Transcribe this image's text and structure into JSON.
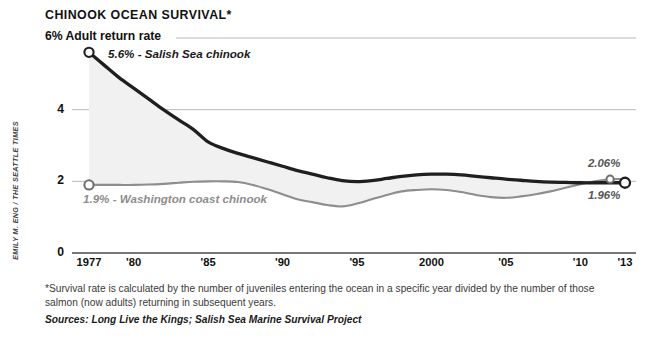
{
  "credit": {
    "text": "EMILY M. ENG / THE SEATTLE TIMES"
  },
  "header": {
    "title": "CHINOOK OCEAN SURVIVAL*",
    "y_axis_top_label": "6% Adult return rate"
  },
  "annotations": {
    "salish_start": "5.6% - Salish Sea chinook",
    "washington_start": "1.9% - Washington coast chinook",
    "washington_end": "2.06%",
    "salish_end": "1.96%"
  },
  "footnotes": {
    "note": "*Survival rate is calculated by the number of juveniles entering the ocean in a specific year divided by the number of those salmon (now adults) returning in subsequent years.",
    "sources": "Sources: Long Live the Kings; Salish Sea Marine Survival Project"
  },
  "colors": {
    "salish_line": "#1f1f1f",
    "washington_line": "#8d8d8d",
    "band_fill": "#f1f1f1",
    "gridline": "#b9b9b9",
    "axis": "#4a4a4a",
    "text": "#111111",
    "muted_text": "#8d8d8d"
  },
  "chart_data": {
    "type": "line",
    "title": "CHINOOK OCEAN SURVIVAL*",
    "subtitle": "",
    "xlabel": "",
    "ylabel": "Adult return rate",
    "units": "%",
    "xlim": [
      1977,
      2013
    ],
    "ylim": [
      0,
      6
    ],
    "yticks": [
      0,
      2,
      4,
      6
    ],
    "ytick_labels": [
      "0",
      "2",
      "4",
      "6"
    ],
    "xticks": [
      1977,
      1980,
      1985,
      1990,
      1995,
      2000,
      2005,
      2010,
      2013
    ],
    "xtick_labels": [
      "1977",
      "'80",
      "'85",
      "'90",
      "'95",
      "2000",
      "'05",
      "'10",
      "'13"
    ],
    "grid": "horizontal",
    "legend": "inline-annotations",
    "fill_between_series": true,
    "x": [
      1977,
      1978,
      1979,
      1980,
      1981,
      1982,
      1983,
      1984,
      1985,
      1986,
      1987,
      1988,
      1989,
      1990,
      1991,
      1992,
      1993,
      1994,
      1995,
      1996,
      1997,
      1998,
      1999,
      2000,
      2001,
      2002,
      2003,
      2004,
      2005,
      2006,
      2007,
      2008,
      2009,
      2010,
      2011,
      2012,
      2013
    ],
    "series": [
      {
        "name": "Salish Sea chinook",
        "color": "#1f1f1f",
        "start_value": 5.6,
        "end_value": 1.96,
        "values": [
          5.6,
          5.25,
          4.9,
          4.6,
          4.3,
          4.0,
          3.72,
          3.45,
          3.1,
          2.92,
          2.78,
          2.66,
          2.54,
          2.42,
          2.3,
          2.2,
          2.1,
          2.02,
          1.99,
          2.02,
          2.08,
          2.14,
          2.18,
          2.2,
          2.2,
          2.18,
          2.14,
          2.1,
          2.06,
          2.03,
          2.0,
          1.98,
          1.97,
          1.96,
          1.96,
          1.96,
          1.96
        ]
      },
      {
        "name": "Washington coast chinook",
        "color": "#8d8d8d",
        "start_value": 1.9,
        "end_value": 2.06,
        "values": [
          1.9,
          1.9,
          1.9,
          1.9,
          1.91,
          1.93,
          1.96,
          1.99,
          2.0,
          2.0,
          1.98,
          1.9,
          1.78,
          1.64,
          1.5,
          1.42,
          1.34,
          1.3,
          1.38,
          1.5,
          1.62,
          1.72,
          1.76,
          1.78,
          1.76,
          1.7,
          1.62,
          1.56,
          1.54,
          1.58,
          1.64,
          1.72,
          1.82,
          1.92,
          2.0,
          2.06,
          2.06
        ]
      }
    ]
  }
}
